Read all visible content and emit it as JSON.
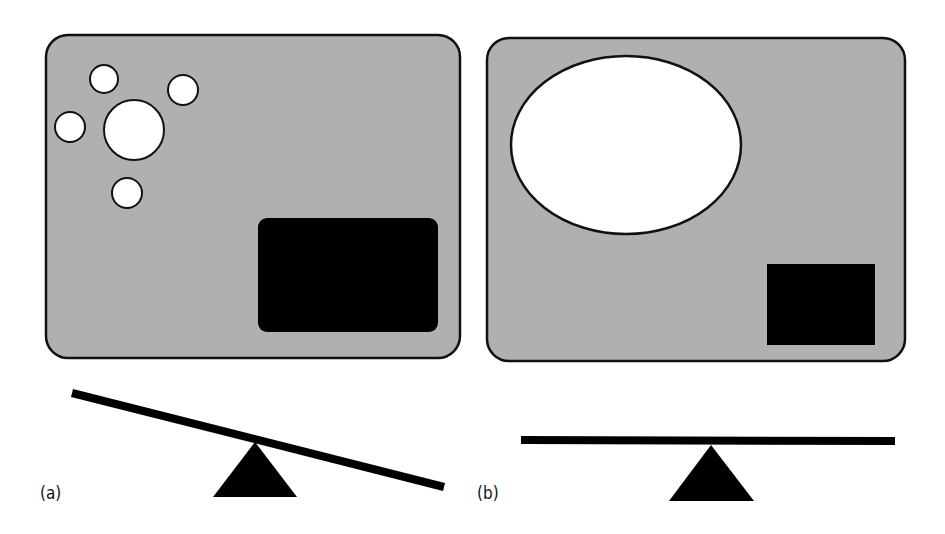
{
  "colors": {
    "panel_fill": "#b0b0b0",
    "outline": "#111111",
    "light_shape": "#ffffff",
    "dark_shape": "#000000"
  },
  "panels": [
    {
      "id": "a",
      "label": "(a)",
      "description": "Box containing five small white circles (one larger, four smaller) and a large black rectangle; lever below tilted down to the right",
      "white_shapes": [
        {
          "type": "circle",
          "cx": 104,
          "cy": 79,
          "r": 14
        },
        {
          "type": "circle",
          "cx": 183,
          "cy": 90,
          "r": 15
        },
        {
          "type": "circle",
          "cx": 70,
          "cy": 127,
          "r": 15
        },
        {
          "type": "circle",
          "cx": 134,
          "cy": 130,
          "r": 30
        },
        {
          "type": "circle",
          "cx": 127,
          "cy": 193,
          "r": 15
        }
      ],
      "black_shape": {
        "type": "rect",
        "x": 258,
        "y": 218,
        "w": 180,
        "h": 114
      },
      "balance": "tilted"
    },
    {
      "id": "b",
      "label": "(b)",
      "description": "Box containing one large white ellipse and a smaller black square; lever below balanced level",
      "white_shapes": [
        {
          "type": "ellipse",
          "cx": 626,
          "cy": 145,
          "rx": 115,
          "ry": 89
        }
      ],
      "black_shape": {
        "type": "rect",
        "x": 767,
        "y": 264,
        "w": 108,
        "h": 81
      },
      "balance": "level"
    }
  ]
}
